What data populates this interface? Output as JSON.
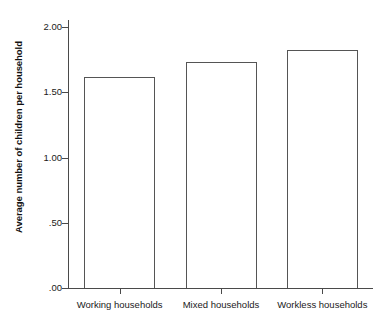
{
  "chart_data": {
    "type": "bar",
    "title": "",
    "subtitle": "",
    "xlabel": "",
    "ylabel": "Average number of children per household",
    "categories": [
      "Working households",
      "Mixed households",
      "Workless households"
    ],
    "values": [
      1.62,
      1.73,
      1.82
    ],
    "ylim": [
      0.0,
      2.0
    ],
    "yticks": [
      0.0,
      0.5,
      1.0,
      1.5,
      2.0
    ],
    "ytick_labels": [
      ".00",
      ".50",
      "1.00",
      "1.50",
      "2.00"
    ],
    "grid": false,
    "legend": null,
    "legend_position": "none",
    "bar_fill_color": "#ffffff",
    "bar_edge_color": "#555555",
    "axis_color": "#4a4a4a",
    "background_color": "#ffffff"
  }
}
